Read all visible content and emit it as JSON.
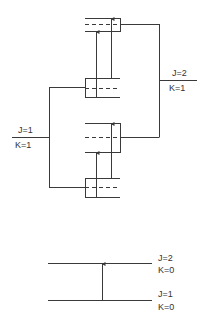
{
  "colors": {
    "line": "#3a3a3a",
    "background": "#ffffff",
    "text": "#333333"
  },
  "top_diagram": {
    "left_level": {
      "j_label": "J=1",
      "k_label": "K=1"
    },
    "right_level": {
      "j_label": "J=2",
      "k_label": "K=1"
    },
    "boxes": [
      {
        "name": "upper-box-1",
        "y_top": 18,
        "y_dash": 24,
        "y_bottom": 31,
        "side": "right"
      },
      {
        "name": "lower-box-1",
        "y_top": 78,
        "y_dash": 88,
        "y_bottom": 97,
        "side": "left"
      },
      {
        "name": "upper-box-2",
        "y_top": 123,
        "y_dash": 137,
        "y_bottom": 152,
        "side": "right"
      },
      {
        "name": "lower-box-2",
        "y_top": 178,
        "y_dash": 187,
        "y_bottom": 197,
        "side": "left"
      }
    ],
    "transitions": [
      {
        "from_box": "lower-box-1",
        "to_box": "upper-box-1",
        "x": 96
      },
      {
        "from_box": "lower-box-1",
        "to_box": "upper-box-1",
        "x": 111
      },
      {
        "from_box": "lower-box-2",
        "to_box": "upper-box-2",
        "x": 96
      },
      {
        "from_box": "lower-box-2",
        "to_box": "upper-box-2",
        "x": 111
      }
    ]
  },
  "bottom_diagram": {
    "upper_level": {
      "j_label": "J=2",
      "k_label": "K=0"
    },
    "lower_level": {
      "j_label": "J=1",
      "k_label": "K=0"
    },
    "transition": {
      "from": "J=1, K=0",
      "to": "J=2, K=0"
    }
  }
}
